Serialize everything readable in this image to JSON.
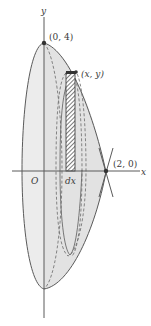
{
  "figure": {
    "type": "solid-of-revolution",
    "labels": {
      "y_axis": "y",
      "x_axis": "x",
      "origin": "O",
      "top_point": "(0, 4)",
      "curve_point": "(x, y)",
      "right_point": "(2, 0)",
      "strip_width": "dx"
    },
    "points": {
      "top": {
        "x": 0,
        "y": 4
      },
      "right": {
        "x": 2,
        "y": 0
      }
    },
    "colors": {
      "line": "#5a5a5a",
      "shade": "#e6e6e6",
      "shade_dark": "#d6d6d6",
      "hatch": "#444444",
      "background": "#ffffff"
    }
  }
}
